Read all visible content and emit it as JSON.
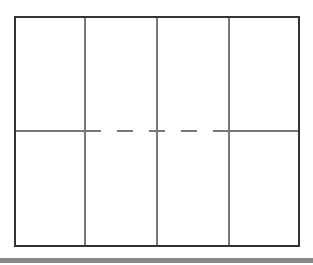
{
  "diagram": {
    "type": "grid-panel-layout",
    "columns": 4,
    "rows": 2,
    "outer_frame": {
      "x1": 15,
      "y1": 17,
      "x2": 299,
      "y2": 246,
      "color": "#333333",
      "stroke_width": 2
    },
    "vertical_dividers": [
      {
        "x": 85,
        "color": "#777777"
      },
      {
        "x": 157,
        "color": "#777777"
      },
      {
        "x": 229,
        "color": "#777777"
      }
    ],
    "horizontal_divider": {
      "y": 131,
      "color": "#777777",
      "solid_segments": [
        {
          "x1": 15,
          "x2": 85
        },
        {
          "x1": 229,
          "x2": 299
        }
      ],
      "dashed_segment": {
        "x1": 85,
        "x2": 229,
        "dash": 16,
        "gap": 16
      }
    },
    "cells": [
      {
        "row": 1,
        "col": 1,
        "label": ""
      },
      {
        "row": 1,
        "col": 2,
        "label": ""
      },
      {
        "row": 1,
        "col": 3,
        "label": ""
      },
      {
        "row": 1,
        "col": 4,
        "label": ""
      },
      {
        "row": 2,
        "col": 1,
        "label": ""
      },
      {
        "row": 2,
        "col": 2,
        "label": ""
      },
      {
        "row": 2,
        "col": 3,
        "label": ""
      },
      {
        "row": 2,
        "col": 4,
        "label": ""
      }
    ]
  },
  "bottom_bar": {
    "color": "#8a8a8a"
  }
}
